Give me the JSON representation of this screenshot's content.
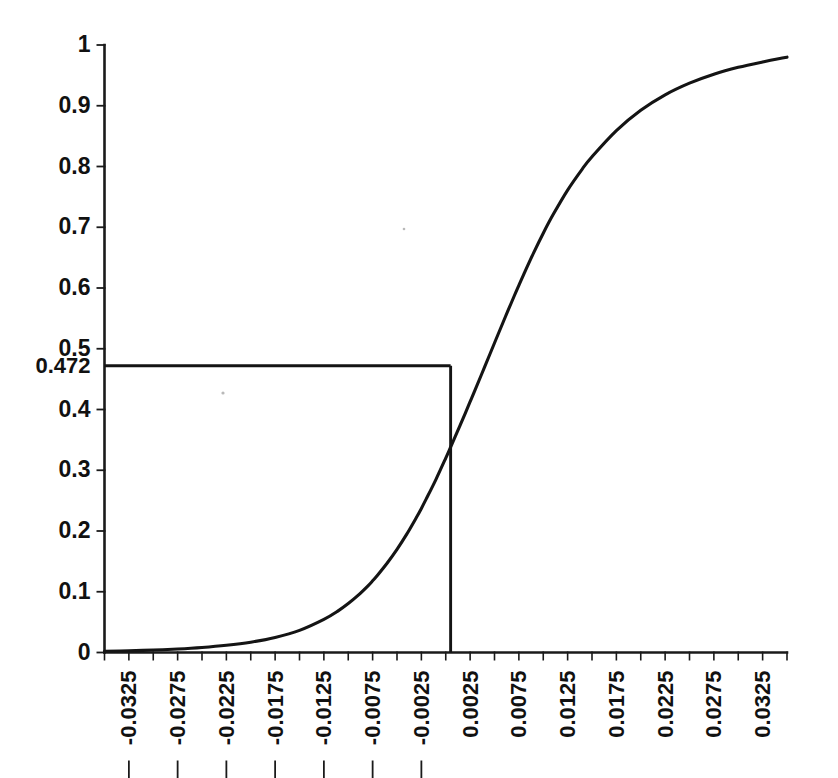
{
  "chart_data": {
    "type": "line",
    "title": "",
    "subtitle": "",
    "xlabel": "",
    "ylabel": "",
    "xlim": [
      -0.035,
      0.035
    ],
    "ylim": [
      0,
      1
    ],
    "grid": false,
    "legend": null,
    "curve_description": "Logistic (sigmoid) cumulative distribution curve rising from 0 at the left to 1 at the right",
    "x_tick_labels": [
      "-0.0325",
      "-0.0275",
      "-0.0225",
      "-0.0175",
      "-0.0125",
      "-0.0075",
      "-0.0025",
      "0.0025",
      "0.0075",
      "0.0125",
      "0.0175",
      "0.0225",
      "0.0275",
      "0.0325"
    ],
    "x_tick_values": [
      -0.0325,
      -0.0275,
      -0.0225,
      -0.0175,
      -0.0125,
      -0.0075,
      -0.0025,
      0.0025,
      0.0075,
      0.0125,
      0.0175,
      0.0225,
      0.0275,
      0.0325
    ],
    "x_minor_step": 0.0025,
    "y_tick_labels": [
      "0",
      "0.1",
      "0.2",
      "0.3",
      "0.4",
      "0.472",
      "0.5",
      "0.6",
      "0.7",
      "0.8",
      "0.9",
      "1"
    ],
    "y_tick_values": [
      0,
      0.1,
      0.2,
      0.3,
      0.4,
      0.472,
      0.5,
      0.6,
      0.7,
      0.8,
      0.9,
      1
    ],
    "annotations": [
      {
        "name": "reference-value",
        "label": "0.472",
        "y": 0.472,
        "x": 0.0005,
        "type": "crosshair",
        "description": "Horizontal line at y = 0.472 from the y-axis to the curve, with a vertical line dropping from the intersection down to the x-axis"
      }
    ],
    "x": [
      -0.035,
      -0.0325,
      -0.03,
      -0.0275,
      -0.025,
      -0.0225,
      -0.02,
      -0.0175,
      -0.015,
      -0.0125,
      -0.011,
      -0.01,
      -0.009,
      -0.008,
      -0.0075,
      -0.007,
      -0.006,
      -0.005,
      -0.004,
      -0.003,
      -0.0025,
      -0.002,
      -0.001,
      0.0,
      0.0005,
      0.001,
      0.002,
      0.0025,
      0.003,
      0.004,
      0.005,
      0.006,
      0.007,
      0.0075,
      0.008,
      0.009,
      0.01,
      0.011,
      0.0125,
      0.014,
      0.015,
      0.0175,
      0.02,
      0.0225,
      0.025,
      0.0275,
      0.03,
      0.0325,
      0.035
    ],
    "y": [
      0.002,
      0.0028,
      0.004,
      0.0057,
      0.0082,
      0.0118,
      0.017,
      0.0248,
      0.0365,
      0.0546,
      0.069,
      0.0806,
      0.094,
      0.1094,
      0.118,
      0.1272,
      0.1473,
      0.1698,
      0.1948,
      0.2225,
      0.2372,
      0.2528,
      0.2851,
      0.32,
      0.3381,
      0.3564,
      0.3938,
      0.4128,
      0.432,
      0.4705,
      0.5095,
      0.5482,
      0.586,
      0.6044,
      0.6226,
      0.6575,
      0.6902,
      0.7204,
      0.7612,
      0.7958,
      0.8162,
      0.8592,
      0.8926,
      0.918,
      0.9372,
      0.9519,
      0.9632,
      0.9721,
      0.98
    ],
    "accent_color": "#141414",
    "background_color": "#ffffff"
  },
  "axes": {
    "y_axis_name": "vertical-axis",
    "x_axis_name": "horizontal-axis"
  }
}
